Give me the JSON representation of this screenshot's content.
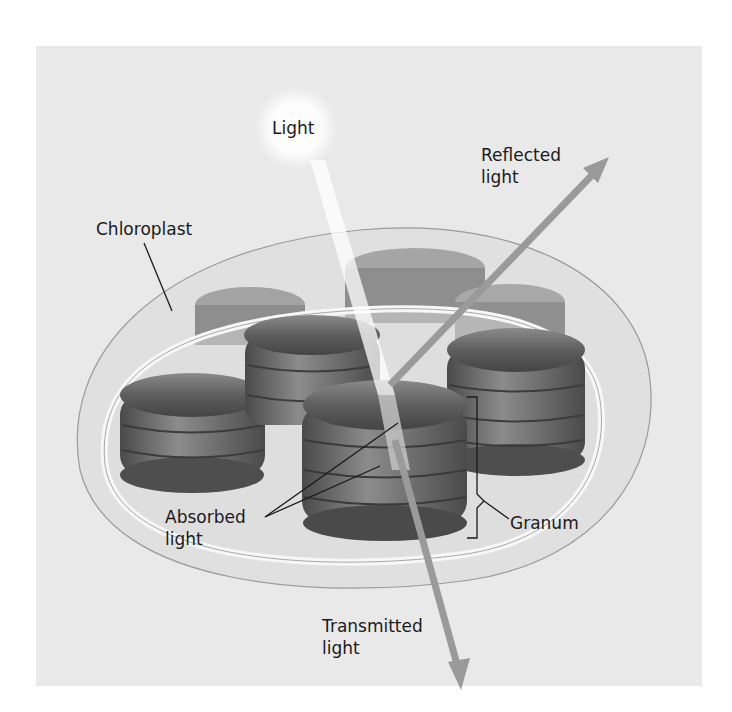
{
  "figure": {
    "labels": {
      "light": "Light",
      "reflected": "Reflected\nlight",
      "chloroplast": "Chloroplast",
      "absorbed": "Absorbed\nlight",
      "granum": "Granum",
      "transmitted": "Transmitted\nlight"
    },
    "colors": {
      "background": "#e9e9e9",
      "granum": "#6a6a6a",
      "arrow": "#9a9a9a",
      "membrane": "#f4f4f4"
    }
  }
}
